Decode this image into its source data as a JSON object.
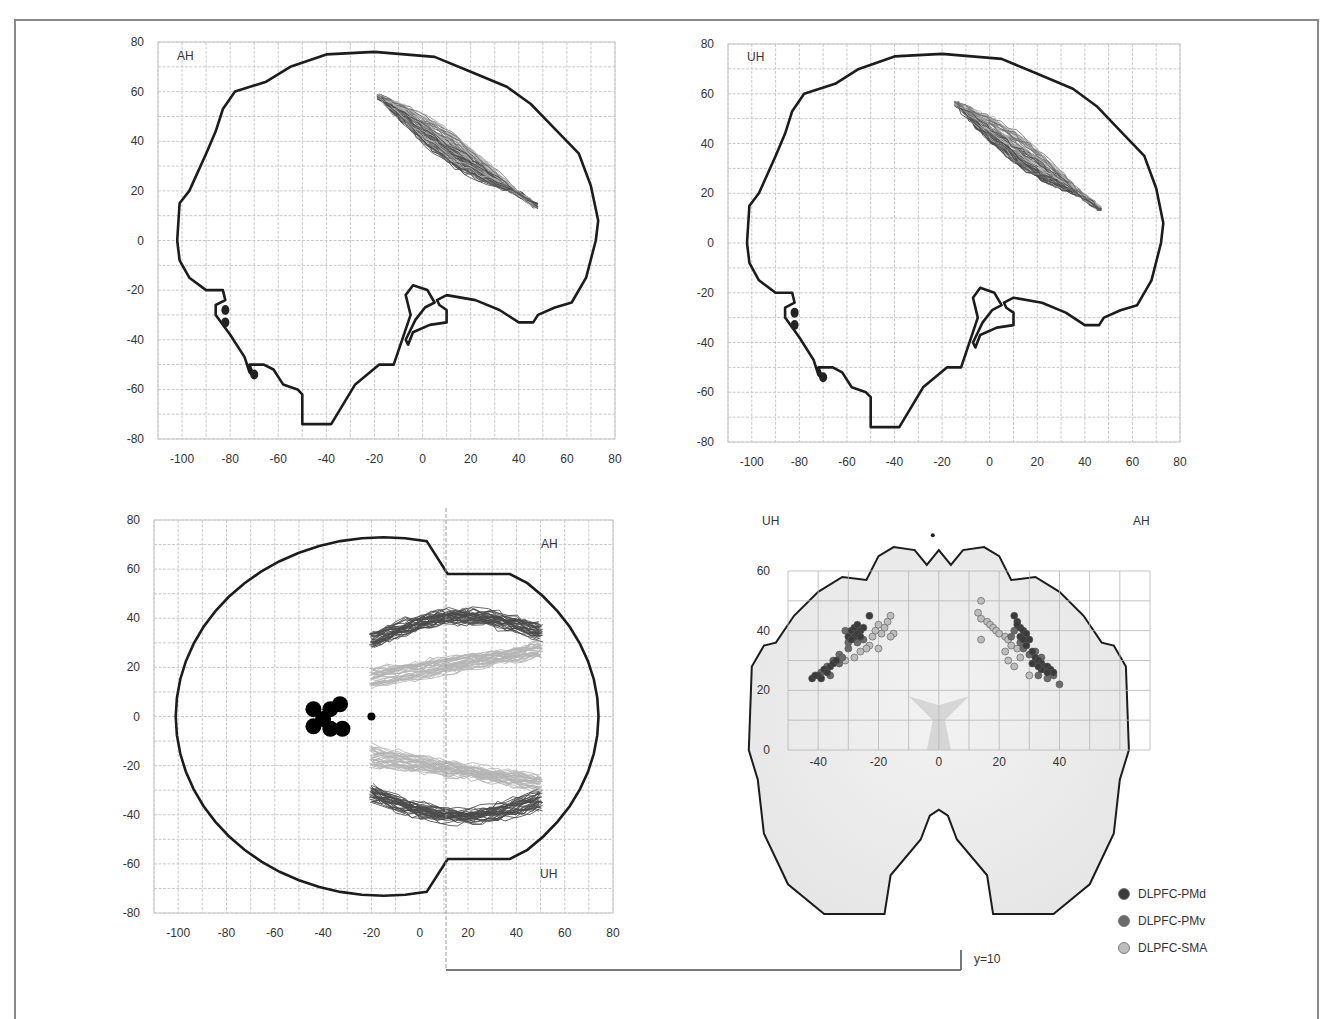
{
  "chart_data": [
    {
      "id": "sagittal-ah",
      "type": "line",
      "title": "",
      "panel_label": "AH",
      "view": "sagittal",
      "xlabel": "",
      "ylabel": "",
      "xlim": [
        -110,
        80
      ],
      "ylim": [
        -80,
        80
      ],
      "xticks": [
        -100,
        -80,
        -60,
        -40,
        -20,
        0,
        20,
        40,
        60,
        80
      ],
      "yticks": [
        80,
        60,
        40,
        20,
        0,
        -20,
        -40,
        -60,
        -80
      ],
      "grid": true,
      "description": "Sagittal brain outline with DLPFC tract bundle running from (-20,60) to (50,10); markers near (-82,-30) and (-70,-55)",
      "bundle": {
        "start": [
          -18,
          58
        ],
        "end": [
          47,
          14
        ],
        "spread": 10
      },
      "markers": [
        [
          -82,
          -28
        ],
        [
          -82,
          -33
        ],
        [
          -70,
          -54
        ]
      ]
    },
    {
      "id": "sagittal-uh",
      "type": "line",
      "title": "",
      "panel_label": "UH",
      "view": "sagittal",
      "xlabel": "",
      "ylabel": "",
      "xlim": [
        -110,
        80
      ],
      "ylim": [
        -80,
        80
      ],
      "xticks": [
        -100,
        -80,
        -60,
        -40,
        -20,
        0,
        20,
        40,
        60,
        80
      ],
      "yticks": [
        80,
        60,
        40,
        20,
        0,
        -20,
        -40,
        -60,
        -80
      ],
      "grid": true,
      "description": "Sagittal brain outline with DLPFC tract bundle running from (-15,60) to (48,10)",
      "bundle": {
        "start": [
          -14,
          56
        ],
        "end": [
          46,
          14
        ],
        "spread": 10
      },
      "markers": [
        [
          -82,
          -28
        ],
        [
          -82,
          -33
        ],
        [
          -70,
          -54
        ]
      ]
    },
    {
      "id": "axial",
      "type": "line",
      "title": "",
      "panel_labels": {
        "top": "AH",
        "bottom": "UH"
      },
      "view": "axial",
      "xlabel": "",
      "ylabel": "",
      "xlim": [
        -110,
        80
      ],
      "ylim": [
        -80,
        80
      ],
      "xticks": [
        -100,
        -80,
        -60,
        -40,
        -20,
        0,
        20,
        40,
        60,
        80
      ],
      "yticks": [
        80,
        60,
        40,
        20,
        0,
        -20,
        -40,
        -60,
        -80
      ],
      "grid": true,
      "reference_line_x": 10,
      "description": "Axial brain outline with bilateral tract bundles: dark bundles near y=±30 to ±40, light bundles near y=±15 to ±25, extending from x=-20 to x=50; black seed cluster around (-40,0) and dot at (-20,0)"
    },
    {
      "id": "coronal",
      "type": "scatter",
      "title": "",
      "view": "coronal",
      "panel_labels": {
        "left": "UH",
        "right": "AH"
      },
      "slice_label": "y=10",
      "xlabel": "",
      "ylabel": "",
      "xlim": [
        -50,
        70
      ],
      "ylim": [
        0,
        60
      ],
      "xticks": [
        -40,
        -20,
        0,
        20,
        40
      ],
      "yticks": [
        60,
        40,
        20,
        0
      ],
      "grid": true,
      "legend": {
        "position": "bottom-right",
        "entries": [
          "DLPFC-PMd",
          "DLPFC-PMv",
          "DLPFC-SMA"
        ]
      },
      "series": [
        {
          "name": "DLPFC-PMd",
          "color": "#3b3b3b",
          "points": [
            [
              -29,
              40
            ],
            [
              -28,
              41
            ],
            [
              -27,
              42
            ],
            [
              -26,
              40
            ],
            [
              -30,
              38
            ],
            [
              -28,
              38
            ],
            [
              -27,
              39
            ],
            [
              -29,
              37
            ],
            [
              -26,
              38
            ],
            [
              -25,
              41
            ],
            [
              -23,
              45
            ],
            [
              -40,
              25
            ],
            [
              -38,
              27
            ],
            [
              -36,
              28
            ],
            [
              -35,
              29
            ],
            [
              -37,
              26
            ],
            [
              -34,
              30
            ],
            [
              -39,
              24
            ],
            [
              -42,
              24
            ],
            [
              -41,
              25
            ],
            [
              25,
              45
            ],
            [
              26,
              43
            ],
            [
              27,
              41
            ],
            [
              28,
              40
            ],
            [
              27,
              38
            ],
            [
              26,
              42
            ],
            [
              29,
              39
            ],
            [
              28,
              37
            ],
            [
              30,
              37
            ],
            [
              29,
              35
            ],
            [
              31,
              33
            ],
            [
              32,
              31
            ],
            [
              33,
              30
            ],
            [
              34,
              29
            ],
            [
              35,
              28
            ],
            [
              36,
              28
            ],
            [
              37,
              27
            ],
            [
              38,
              26
            ],
            [
              34,
              27
            ],
            [
              36,
              26
            ],
            [
              31,
              29
            ],
            [
              33,
              28
            ]
          ]
        },
        {
          "name": "DLPFC-PMv",
          "color": "#6b6b6b",
          "points": [
            [
              -31,
              40
            ],
            [
              -30,
              36
            ],
            [
              -27,
              36
            ],
            [
              -25,
              37
            ],
            [
              -33,
              32
            ],
            [
              -32,
              31
            ],
            [
              -35,
              30
            ],
            [
              -37,
              28
            ],
            [
              -39,
              26
            ],
            [
              -36,
              25
            ],
            [
              -33,
              29
            ],
            [
              -30,
              34
            ],
            [
              25,
              40
            ],
            [
              24,
              38
            ],
            [
              27,
              36
            ],
            [
              28,
              34
            ],
            [
              30,
              32
            ],
            [
              32,
              33
            ],
            [
              34,
              31
            ],
            [
              33,
              25
            ],
            [
              36,
              24
            ],
            [
              38,
              25
            ],
            [
              40,
              22
            ],
            [
              35,
              27
            ]
          ]
        },
        {
          "name": "DLPFC-SMA",
          "color": "#bdbdbd",
          "points": [
            [
              -22,
              38
            ],
            [
              -21,
              40
            ],
            [
              -20,
              42
            ],
            [
              -18,
              41
            ],
            [
              -17,
              43
            ],
            [
              -16,
              45
            ],
            [
              -15,
              39
            ],
            [
              -16,
              38
            ],
            [
              -19,
              39
            ],
            [
              -23,
              35
            ],
            [
              -24,
              34
            ],
            [
              -26,
              33
            ],
            [
              -28,
              31
            ],
            [
              -20,
              34
            ],
            [
              -31,
              30
            ],
            [
              14,
              50
            ],
            [
              13,
              46
            ],
            [
              14,
              44
            ],
            [
              16,
              43
            ],
            [
              17,
              42
            ],
            [
              18,
              41
            ],
            [
              19,
              40
            ],
            [
              20,
              39
            ],
            [
              22,
              38
            ],
            [
              23,
              37
            ],
            [
              24,
              35
            ],
            [
              22,
              33
            ],
            [
              23,
              30
            ],
            [
              25,
              28
            ],
            [
              14,
              37
            ],
            [
              30,
              25
            ],
            [
              26,
              34
            ],
            [
              27,
              31
            ]
          ]
        }
      ]
    }
  ],
  "figure": {
    "bracket_label": "y=10",
    "legend": [
      {
        "label": "DLPFC-PMd",
        "color": "#3b3b3b"
      },
      {
        "label": "DLPFC-PMv",
        "color": "#6b6b6b"
      },
      {
        "label": "DLPFC-SMA",
        "color": "#bdbdbd"
      }
    ],
    "colors": {
      "outline": "#1c1c1c",
      "grid": "#c8c8c8",
      "tract_dark": "#4a4a4a",
      "tract_mid": "#707070",
      "tract_light": "#b4b4b4",
      "seed": "#000000",
      "frame": "#8a8a8a"
    }
  }
}
